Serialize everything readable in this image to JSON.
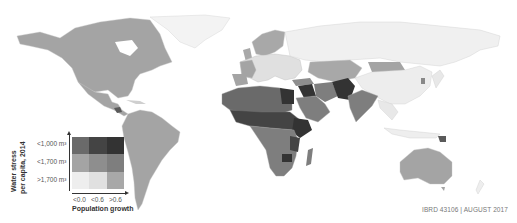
{
  "map": {
    "type": "bivariate choropleth world map",
    "colors": {
      "ocean": "#ffffff",
      "low_low": "#eeeeee",
      "low_mid": "#e0e0e0",
      "low_high": "#a8a8a8",
      "mid_low": "#a4a4a4",
      "mid_mid": "#8e8e8e",
      "mid_high": "#7e7e7e",
      "high_low": "#6a6a6a",
      "high_mid": "#444444",
      "high_high": "#333333"
    }
  },
  "legend": {
    "y_title_line1": "Water stress",
    "y_title_line2": "per capita, 2014",
    "rows": [
      "<1,000 m³",
      "<1,700 m³",
      ">1,700 m³"
    ],
    "columns": [
      "<0.0",
      "<0.6",
      ">0.6"
    ],
    "x_title": "Population growth",
    "grid_colors": [
      [
        "#6a6a6a",
        "#444444",
        "#333333"
      ],
      [
        "#a4a4a4",
        "#8e8e8e",
        "#7e7e7e"
      ],
      [
        "#eeeeee",
        "#e0e0e0",
        "#a8a8a8"
      ]
    ]
  },
  "credit": "IBRD 43106  |  AUGUST 2017"
}
